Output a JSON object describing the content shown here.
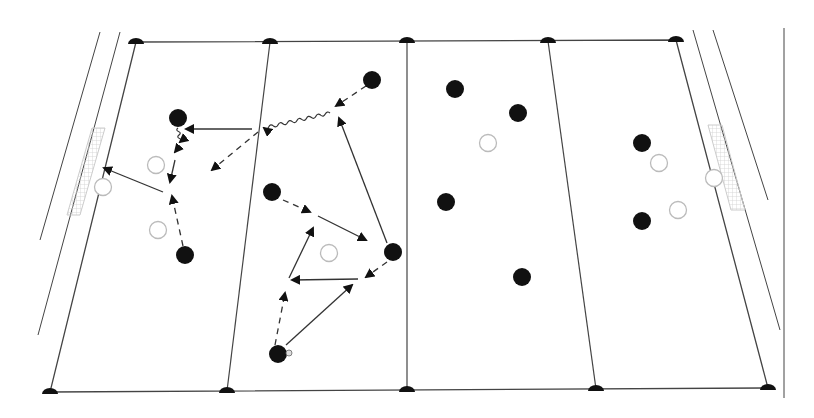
{
  "diagram": {
    "title": "Soccer tactical drill diagram",
    "kind": "tactics-board",
    "colors": {
      "line": "#444444",
      "player": "#111111",
      "opponent_stroke": "#bbbbbb",
      "goal_net": "#cccccc",
      "background": "#ffffff"
    },
    "field": {
      "top_left": [
        136,
        42
      ],
      "top_right": [
        676,
        40
      ],
      "bottom_left": [
        50,
        392
      ],
      "bottom_right": [
        768,
        388
      ],
      "top_markers": [
        [
          136,
          42
        ],
        [
          270,
          42
        ],
        [
          407,
          41
        ],
        [
          548,
          41
        ],
        [
          676,
          40
        ]
      ],
      "bottom_markers": [
        [
          50,
          392
        ],
        [
          227,
          391
        ],
        [
          407,
          390
        ],
        [
          596,
          389
        ],
        [
          768,
          388
        ]
      ],
      "zone_lines": [
        [
          [
            270,
            42
          ],
          [
            227,
            391
          ]
        ],
        [
          [
            407,
            41
          ],
          [
            407,
            390
          ]
        ],
        [
          [
            548,
            41
          ],
          [
            596,
            389
          ]
        ]
      ],
      "outer_left_lines": [
        [
          [
            100,
            32
          ],
          [
            40,
            240
          ]
        ],
        [
          [
            120,
            32
          ],
          [
            38,
            335
          ]
        ]
      ],
      "outer_right_lines": [
        [
          [
            693,
            30
          ],
          [
            780,
            330
          ]
        ],
        [
          [
            713,
            30
          ],
          [
            768,
            200
          ]
        ],
        [
          [
            784,
            28
          ],
          [
            784,
            398
          ]
        ]
      ]
    },
    "players_black": [
      {
        "id": "p1",
        "x": 178,
        "y": 118
      },
      {
        "id": "p2",
        "x": 372,
        "y": 80
      },
      {
        "id": "p3",
        "x": 272,
        "y": 192
      },
      {
        "id": "p4",
        "x": 185,
        "y": 255
      },
      {
        "id": "p5",
        "x": 393,
        "y": 252
      },
      {
        "id": "p6",
        "x": 278,
        "y": 354
      },
      {
        "id": "p7",
        "x": 455,
        "y": 89
      },
      {
        "id": "p8",
        "x": 518,
        "y": 113
      },
      {
        "id": "p9",
        "x": 446,
        "y": 202
      },
      {
        "id": "p10",
        "x": 522,
        "y": 277
      },
      {
        "id": "p11",
        "x": 642,
        "y": 143
      },
      {
        "id": "p12",
        "x": 642,
        "y": 221
      }
    ],
    "players_white": [
      {
        "id": "o1",
        "x": 156,
        "y": 165
      },
      {
        "id": "o2",
        "x": 103,
        "y": 187
      },
      {
        "id": "o3",
        "x": 158,
        "y": 230
      },
      {
        "id": "o4",
        "x": 329,
        "y": 253
      },
      {
        "id": "o5",
        "x": 488,
        "y": 143
      },
      {
        "id": "o6",
        "x": 659,
        "y": 163
      },
      {
        "id": "o7",
        "x": 714,
        "y": 178
      },
      {
        "id": "o8",
        "x": 678,
        "y": 210
      }
    ],
    "ball": {
      "x": 289,
      "y": 353
    },
    "goals": [
      {
        "side": "left",
        "points": [
          [
            92,
            128
          ],
          [
            105,
            128
          ],
          [
            80,
            215
          ],
          [
            67,
            215
          ]
        ]
      },
      {
        "side": "right",
        "points": [
          [
            708,
            125
          ],
          [
            722,
            125
          ],
          [
            745,
            210
          ],
          [
            731,
            210
          ]
        ]
      }
    ],
    "movements": [
      {
        "type": "dashed",
        "from": [
          366,
          86
        ],
        "to": [
          336,
          106
        ],
        "note": "run"
      },
      {
        "type": "wavy",
        "from": [
          330,
          113
        ],
        "to": [
          264,
          128
        ],
        "note": "dribble"
      },
      {
        "type": "solid",
        "from": [
          252,
          129
        ],
        "to": [
          186,
          129
        ],
        "note": "pass"
      },
      {
        "type": "dashed",
        "from": [
          258,
          132
        ],
        "to": [
          212,
          170
        ],
        "note": "run"
      },
      {
        "type": "wavy",
        "from": [
          178,
          128
        ],
        "to": [
          180,
          142
        ],
        "note": "dribble"
      },
      {
        "type": "solid",
        "from": [
          180,
          146
        ],
        "to": [
          175,
          152
        ],
        "note": "pass"
      },
      {
        "type": "solid",
        "from": [
          175,
          160
        ],
        "to": [
          170,
          182
        ],
        "note": "pass"
      },
      {
        "type": "solid",
        "from": [
          163,
          192
        ],
        "to": [
          104,
          168
        ],
        "note": "pass"
      },
      {
        "type": "dashed",
        "from": [
          183,
          246
        ],
        "to": [
          172,
          196
        ],
        "note": "run"
      },
      {
        "type": "dashed",
        "from": [
          283,
          200
        ],
        "to": [
          310,
          212
        ],
        "note": "run"
      },
      {
        "type": "solid",
        "from": [
          318,
          216
        ],
        "to": [
          366,
          240
        ],
        "note": "pass"
      },
      {
        "type": "solid",
        "from": [
          387,
          243
        ],
        "to": [
          339,
          118
        ],
        "note": "pass"
      },
      {
        "type": "dashed",
        "from": [
          387,
          262
        ],
        "to": [
          366,
          277
        ],
        "note": "run"
      },
      {
        "type": "solid",
        "from": [
          358,
          279
        ],
        "to": [
          292,
          280
        ],
        "note": "pass"
      },
      {
        "type": "dashed",
        "from": [
          275,
          345
        ],
        "to": [
          285,
          293
        ],
        "note": "run"
      },
      {
        "type": "solid",
        "from": [
          289,
          278
        ],
        "to": [
          313,
          228
        ],
        "note": "pass"
      },
      {
        "type": "solid",
        "from": [
          286,
          345
        ],
        "to": [
          352,
          285
        ],
        "note": "pass"
      }
    ],
    "legend_names": {
      "black-circle": "attacking-player",
      "white-circle": "defending-player",
      "solid-arrow": "pass",
      "dashed-arrow": "player-run",
      "wavy-arrow": "dribble"
    }
  }
}
